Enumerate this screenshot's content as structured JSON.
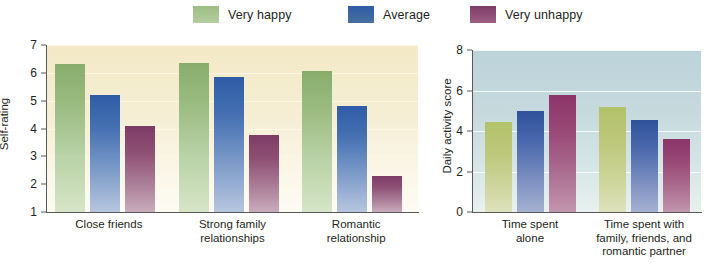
{
  "legend": {
    "items": [
      {
        "label": "Very happy",
        "color": "#9cbd84"
      },
      {
        "label": "Average",
        "color": "#34619f"
      },
      {
        "label": "Very unhappy",
        "color": "#8c4a72"
      }
    ]
  },
  "chart_data": [
    {
      "type": "bar",
      "id": "self-rating",
      "title": "",
      "xlabel": "",
      "ylabel": "Self-rating",
      "ylim": [
        1,
        7
      ],
      "yticks": [
        1,
        2,
        3,
        4,
        5,
        6,
        7
      ],
      "grid": true,
      "legend_position": "top",
      "categories": [
        "Close friends",
        "Strong family\nrelationships",
        "Romantic\nrelationship"
      ],
      "series": [
        {
          "name": "Very happy",
          "values": [
            6.3,
            6.35,
            6.05
          ]
        },
        {
          "name": "Average",
          "values": [
            5.2,
            5.85,
            4.8
          ]
        },
        {
          "name": "Very unhappy",
          "values": [
            4.1,
            3.75,
            2.3
          ]
        }
      ]
    },
    {
      "type": "bar",
      "id": "daily-activity",
      "title": "",
      "xlabel": "",
      "ylabel": "Daily activity score",
      "ylim": [
        0,
        8
      ],
      "yticks": [
        0,
        2,
        4,
        6,
        8
      ],
      "grid": true,
      "legend_position": "top",
      "categories": [
        "Time spent\nalone",
        "Time spent with\nfamily, friends, and\nromantic partner"
      ],
      "series": [
        {
          "name": "Very happy",
          "values": [
            4.45,
            5.2
          ]
        },
        {
          "name": "Average",
          "values": [
            5.0,
            4.55
          ]
        },
        {
          "name": "Very unhappy",
          "values": [
            5.8,
            3.6
          ]
        }
      ]
    }
  ]
}
